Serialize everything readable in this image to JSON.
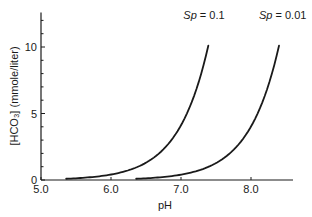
{
  "chart_data": {
    "type": "line",
    "title": "",
    "xlabel": "pH",
    "ylabel": "[HCO₃] (mmole/liter)",
    "xlim": [
      5.0,
      8.6
    ],
    "ylim": [
      0,
      12.6
    ],
    "x_ticks": [
      5.0,
      6.0,
      7.0,
      8.0
    ],
    "x_tick_labels": [
      "5.0",
      "6.0",
      "7.0",
      "8.0"
    ],
    "y_ticks_labeled": [
      0,
      5,
      10
    ],
    "y_tick_labels": [
      "0",
      "5",
      "10"
    ],
    "y_minor_ticks": [
      1,
      2,
      3,
      4,
      6,
      7,
      8,
      9,
      11,
      12
    ],
    "grid": false,
    "legend": "inline labels at curve ends",
    "series": [
      {
        "name": "Sp = 0.1",
        "label_prefix": "Sp",
        "label_value": "= 0.1",
        "x": [
          5.36,
          5.6,
          5.8,
          6.0,
          6.2,
          6.4,
          6.6,
          6.8,
          7.0,
          7.1,
          7.2,
          7.3,
          7.39
        ],
        "values": [
          0.09,
          0.16,
          0.26,
          0.41,
          0.65,
          1.03,
          1.64,
          2.59,
          4.1,
          5.17,
          6.51,
          8.2,
          10.1
        ]
      },
      {
        "name": "Sp = 0.01",
        "label_prefix": "Sp",
        "label_value": "= 0.01",
        "x": [
          6.36,
          6.6,
          6.8,
          7.0,
          7.2,
          7.4,
          7.6,
          7.8,
          8.0,
          8.1,
          8.2,
          8.3,
          8.4
        ],
        "values": [
          0.09,
          0.16,
          0.26,
          0.41,
          0.65,
          1.03,
          1.64,
          2.59,
          4.1,
          5.17,
          6.51,
          8.2,
          10.1
        ]
      }
    ]
  },
  "axes": {
    "x_title": "pH",
    "y_title": "[HCO₃] (mmole/liter)"
  },
  "colors": {
    "line": "#1a1a1a",
    "axis": "#1a1a1a",
    "background": "#ffffff"
  }
}
